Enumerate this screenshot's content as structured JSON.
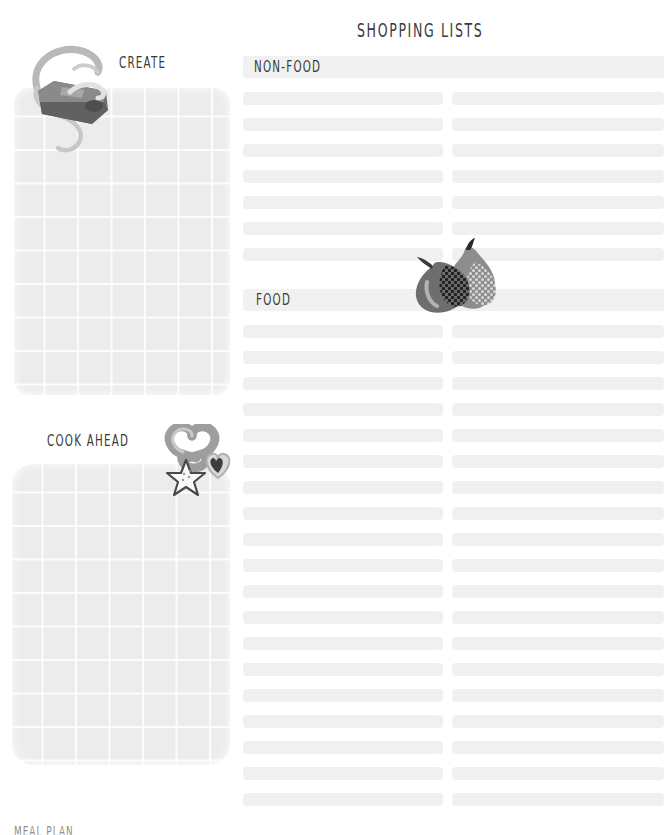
{
  "page": {
    "title": "SHOPPING LISTS",
    "footer_note": "MEAL PLAN",
    "paper_color": "#ffffff",
    "ink_color": "#3a3a3a",
    "row_color": "#f0f0f0",
    "panel_color": "#ececec"
  },
  "left_column": {
    "create": {
      "label": "CREATE",
      "panel_style": "grid-paper",
      "icon": "pencil-sharpener-illustration"
    },
    "cook_ahead": {
      "label": "COOK AHEAD",
      "panel_style": "grid-paper",
      "icon": "cookie-cutters-illustration"
    }
  },
  "lists": {
    "sections": [
      {
        "heading": "NON-FOOD",
        "rows": [
          {
            "left": "",
            "right": ""
          },
          {
            "left": "",
            "right": ""
          },
          {
            "left": "",
            "right": ""
          },
          {
            "left": "",
            "right": ""
          },
          {
            "left": "",
            "right": ""
          },
          {
            "left": "",
            "right": ""
          },
          {
            "left": "",
            "right": ""
          }
        ]
      },
      {
        "heading": "FOOD",
        "icon": "figs-illustration",
        "rows": [
          {
            "left": "",
            "right": ""
          },
          {
            "left": "",
            "right": ""
          },
          {
            "left": "",
            "right": ""
          },
          {
            "left": "",
            "right": ""
          },
          {
            "left": "",
            "right": ""
          },
          {
            "left": "",
            "right": ""
          },
          {
            "left": "",
            "right": ""
          },
          {
            "left": "",
            "right": ""
          },
          {
            "left": "",
            "right": ""
          },
          {
            "left": "",
            "right": ""
          },
          {
            "left": "",
            "right": ""
          },
          {
            "left": "",
            "right": ""
          },
          {
            "left": "",
            "right": ""
          },
          {
            "left": "",
            "right": ""
          },
          {
            "left": "",
            "right": ""
          },
          {
            "left": "",
            "right": ""
          },
          {
            "left": "",
            "right": ""
          },
          {
            "left": "",
            "right": ""
          },
          {
            "left": "",
            "right": ""
          }
        ]
      }
    ],
    "row_geometry": {
      "first_row_top_nonfood": 92,
      "first_row_top_food": 325,
      "row_pitch": 26,
      "row_height": 13
    }
  }
}
